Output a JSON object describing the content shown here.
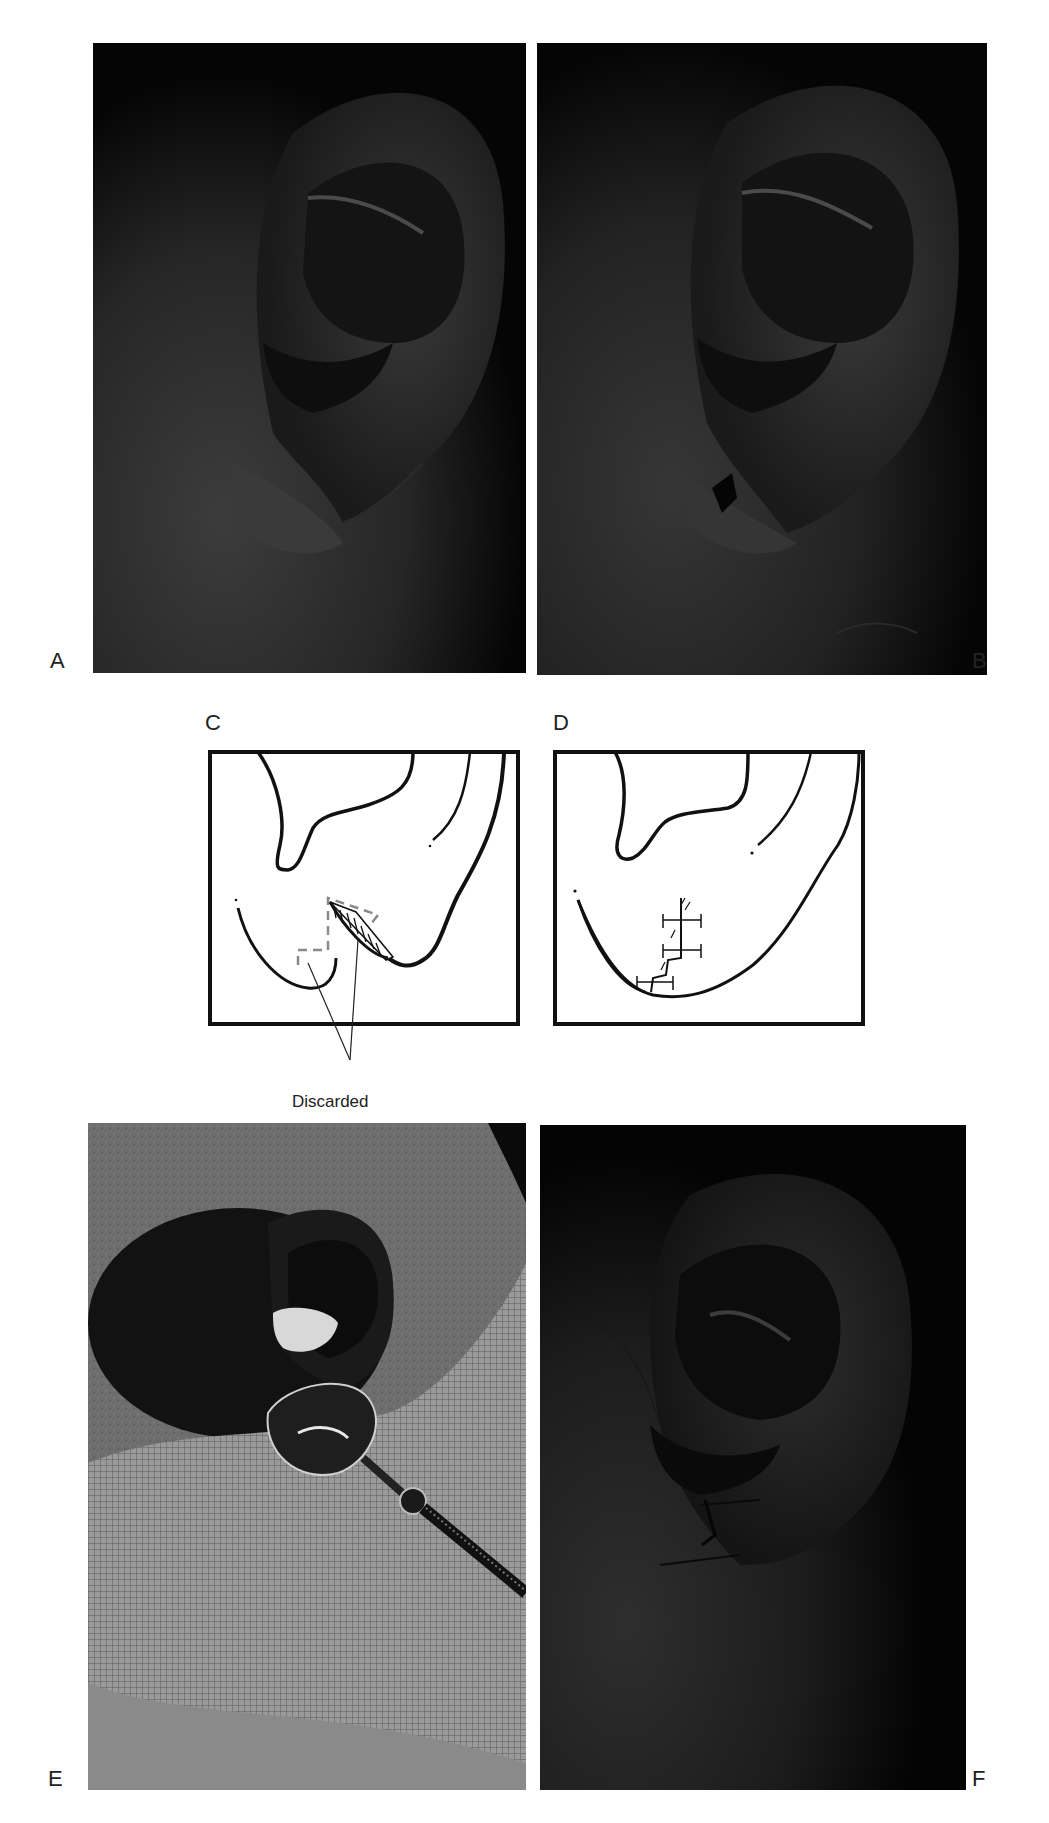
{
  "figure": {
    "panels": [
      {
        "id": "A",
        "label": "A",
        "type": "photo",
        "description": "Preoperative ear with cleft earlobe"
      },
      {
        "id": "B",
        "label": "B",
        "type": "photo",
        "description": "Ear with marked incision on earlobe"
      },
      {
        "id": "C",
        "label": "C",
        "type": "diagram",
        "description": "Z-plasty design with discarded tissue shaded"
      },
      {
        "id": "D",
        "label": "D",
        "type": "diagram",
        "description": "Sutured repair"
      },
      {
        "id": "E",
        "label": "E",
        "type": "photo",
        "description": "Intraoperative ear with cotton and spoon retractor on gauze"
      },
      {
        "id": "F",
        "label": "F",
        "type": "photo",
        "description": "Postoperative ear with sutures"
      }
    ],
    "annotations": {
      "discarded": "Discarded"
    },
    "colors": {
      "background": "#ffffff",
      "photo_dark": "#0a0a0a",
      "skin_tone": "#3a3a3a",
      "gauze": "#8c8c8c",
      "line": "#111111",
      "dashed": "#8a8a8a"
    }
  }
}
